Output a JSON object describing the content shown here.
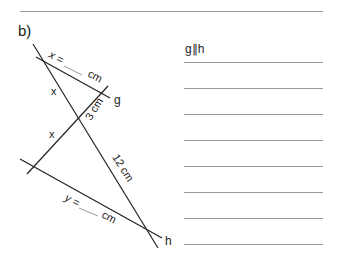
{
  "part": "b)",
  "condition": "g∥h",
  "figure": {
    "lines": {
      "g": "g",
      "h": "h"
    },
    "labels": {
      "x_top": "x",
      "x_bottom": "x",
      "segment_gB": "3 cm",
      "segment_long": "12 cm",
      "x_eq": "x =",
      "x_unit": "cm",
      "y_eq": "y =",
      "y_unit": "cm"
    }
  },
  "answer_lines": [
    1,
    2,
    3,
    4,
    5,
    6,
    7,
    8
  ]
}
